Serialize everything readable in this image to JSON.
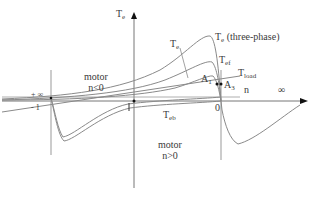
{
  "diagram": {
    "type": "torque-speed characteristic",
    "axes": {
      "y_label_main": "T",
      "y_label_sub": "e",
      "x_label": "n",
      "x_infinity": "∞",
      "left_infinity": "+ ∞",
      "left_minus_one": "- 1",
      "tick_one": "1",
      "origin_zero": "0"
    },
    "curves": [
      {
        "id": "te-three-phase",
        "label_main": "T",
        "label_sub": "e",
        "label_suffix": " (three-phase)"
      },
      {
        "id": "tef",
        "label_main": "T",
        "label_sub": "ef"
      },
      {
        "id": "te",
        "label_main": "T",
        "label_sub": "e"
      },
      {
        "id": "teb",
        "label_main": "T",
        "label_sub": "eb"
      },
      {
        "id": "tload",
        "label_main": "T",
        "label_sub": "load"
      }
    ],
    "points": [
      {
        "id": "A1",
        "label_main": "A",
        "label_sub": "1"
      },
      {
        "id": "A3",
        "label_main": "A",
        "label_sub": "3"
      }
    ],
    "regions": {
      "upper_left_line1": "motor",
      "upper_left_line2": "n<0",
      "lower_line1": "motor",
      "lower_line2": "n>0"
    },
    "colors": {
      "axis": "#555555",
      "curve": "#8a8a8a",
      "text": "#3a3a3a",
      "marker": "#111111"
    }
  }
}
